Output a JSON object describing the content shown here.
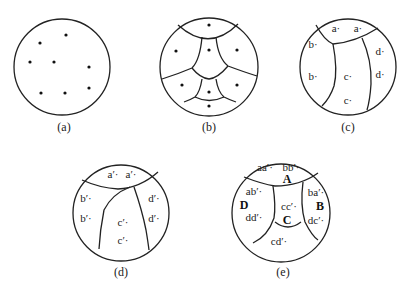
{
  "panels": {
    "a": {
      "caption": "(a)",
      "points": 8
    },
    "b": {
      "caption": "(b)",
      "regions": 9
    },
    "c": {
      "caption": "(c)",
      "labels": {
        "a1": "a·",
        "a2": "a·",
        "b1": "b·",
        "b2": "b·",
        "c1": "c·",
        "c2": "c·",
        "d1": "d·",
        "d2": "d·"
      }
    },
    "d": {
      "caption": "(d)",
      "labels": {
        "a1": "a′·",
        "a2": "a′·",
        "b1": "b′·",
        "b2": "b′·",
        "c1": "c′·",
        "c2": "c′·",
        "d1": "d′·",
        "d2": "d′·"
      }
    },
    "e": {
      "caption": "(e)",
      "labels": {
        "aa": "aa′·",
        "bb": "bb′·",
        "A": "A",
        "ab": "ab′·",
        "D": "D",
        "dd": "dd′·",
        "cc": "cc′·",
        "C": "C",
        "ba": "ba′·",
        "B": "B",
        "dc": "dc′·",
        "cd": "cd′·"
      }
    }
  }
}
